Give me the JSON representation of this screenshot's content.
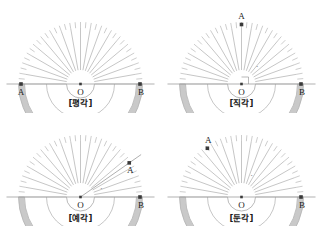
{
  "figure": {
    "background_color": "#ffffff",
    "band_color": "#b3b3b3",
    "band_fill": "#c9c9c9",
    "tick_color": "#9a9a9a",
    "line_color": "#8c8c8c",
    "baseline_color": "#a8a8a8",
    "point_color": "#3a3a3a",
    "label_color": "#1a1a1a"
  },
  "panels": [
    {
      "id": "straight-angle",
      "caption": "[평각]",
      "angle_degrees": 180,
      "center_label": "O",
      "point_a_label": "A",
      "point_b_label": "B",
      "point_a_angle": 180,
      "point_b_angle": 0,
      "show_ray": false,
      "show_right_angle_mark": false,
      "show_arc_mark": false,
      "a_label_position": "below-left",
      "b_label_position": "below-right"
    },
    {
      "id": "right-angle",
      "caption": "[직각]",
      "angle_degrees": 90,
      "center_label": "O",
      "point_a_label": "A",
      "point_b_label": "B",
      "point_a_angle": 90,
      "point_b_angle": 0,
      "show_ray": false,
      "show_right_angle_mark": true,
      "show_arc_mark": true,
      "a_label_position": "above",
      "b_label_position": "below-right"
    },
    {
      "id": "acute-angle",
      "caption": "[예각]",
      "angle_degrees": 35,
      "center_label": "O",
      "point_a_label": "A",
      "point_b_label": "B",
      "point_a_angle": 35,
      "point_b_angle": 0,
      "show_ray": true,
      "show_right_angle_mark": false,
      "show_arc_mark": true,
      "a_label_position": "below-right",
      "b_label_position": "below-right"
    },
    {
      "id": "obtuse-angle",
      "caption": "[둔각]",
      "angle_degrees": 125,
      "center_label": "O",
      "point_a_label": "A",
      "point_b_label": "B",
      "point_a_angle": 125,
      "point_b_angle": 0,
      "show_ray": false,
      "show_right_angle_mark": false,
      "show_arc_mark": true,
      "a_label_position": "above-left",
      "b_label_position": "below-right"
    }
  ],
  "protractor": {
    "major_tick_step_degrees": 10,
    "minor_tick_step_degrees": 5,
    "outer_radius": 62,
    "band_inner_radius": 56,
    "hub_radius": 14,
    "mid_ring_radius": 34
  }
}
